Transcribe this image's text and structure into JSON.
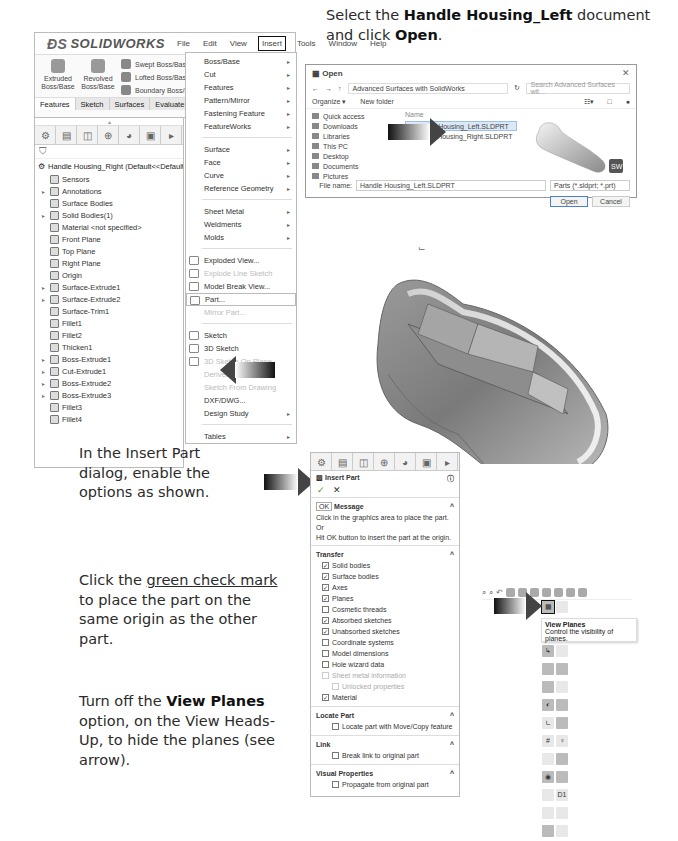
{
  "instructions": {
    "step1": {
      "pre": "Select the ",
      "bold": "Handle Housing_Left",
      "mid": " document and click ",
      "bold2": "Open",
      "post": "."
    },
    "step2": {
      "text": "In the Insert Part dialog, enable the options as shown."
    },
    "step3": {
      "pre": "Click the ",
      "link": "green check mark",
      "post": " to place the part on the same origin as the other part."
    },
    "step4": {
      "pre": "Turn off the ",
      "bold": "View Planes",
      "post": " option, on the View Heads-Up, to hide the planes (see arrow)."
    }
  },
  "solidworks": {
    "logo": "SOLIDWORKS",
    "menu": [
      "File",
      "Edit",
      "View",
      "Insert",
      "Tools",
      "Window",
      "Help"
    ],
    "ribbon": {
      "extruded": "Extruded Boss/Base",
      "revolved": "Revolved Boss/Base",
      "swept": "Swept Boss/Base",
      "lofted": "Lofted Boss/Base",
      "boundary": "Boundary Boss/Base"
    },
    "tabs": [
      "Features",
      "Sketch",
      "Surfaces",
      "Evaluate"
    ],
    "tree_root": "Handle Housing_Right (Default<<Default>_Di",
    "tree": [
      {
        "label": "Sensors",
        "exp": false
      },
      {
        "label": "Annotations",
        "exp": true
      },
      {
        "label": "Surface Bodies",
        "exp": false
      },
      {
        "label": "Solid Bodies(1)",
        "exp": true
      },
      {
        "label": "Material <not specified>",
        "exp": false
      },
      {
        "label": "Front Plane",
        "exp": false
      },
      {
        "label": "Top Plane",
        "exp": false
      },
      {
        "label": "Right Plane",
        "exp": false
      },
      {
        "label": "Origin",
        "exp": false
      },
      {
        "label": "Surface-Extrude1",
        "exp": true
      },
      {
        "label": "Surface-Extrude2",
        "exp": true
      },
      {
        "label": "Surface-Trim1",
        "exp": false
      },
      {
        "label": "Fillet1",
        "exp": false
      },
      {
        "label": "Fillet2",
        "exp": false
      },
      {
        "label": "Thicken1",
        "exp": false
      },
      {
        "label": "Boss-Extrude1",
        "exp": true
      },
      {
        "label": "Cut-Extrude1",
        "exp": true
      },
      {
        "label": "Boss-Extrude2",
        "exp": true
      },
      {
        "label": "Boss-Extrude3",
        "exp": true
      },
      {
        "label": "Fillet3",
        "exp": false
      },
      {
        "label": "Fillet4",
        "exp": false
      }
    ]
  },
  "insert_menu": {
    "group1": [
      "Boss/Base",
      "Cut",
      "Features",
      "Pattern/Mirror",
      "Fastening Feature",
      "FeatureWorks"
    ],
    "group2": [
      "Surface",
      "Face",
      "Curve",
      "Reference Geometry"
    ],
    "group3": [
      "Sheet Metal",
      "Weldments",
      "Molds"
    ],
    "group4": [
      "Exploded View...",
      "Explode Line Sketch",
      "Model Break View...",
      "Part...",
      "Mirror Part..."
    ],
    "group5": [
      "Sketch",
      "3D Sketch",
      "3D Sketch On Plane",
      "Derived Sketch",
      "Sketch From Drawing",
      "DXF/DWG...",
      "Design Study"
    ],
    "group6": [
      "Tables"
    ]
  },
  "open_dialog": {
    "title": "Open",
    "path": "Advanced Surfaces with SolidWorks",
    "search_placeholder": "Search Advanced Surfaces wit...",
    "organize": "Organize ▾",
    "new_folder": "New folder",
    "nav": [
      "Quick access",
      "Downloads",
      "Libraries",
      "This PC",
      "Desktop",
      "Documents",
      "Pictures"
    ],
    "col_name": "Name",
    "files": [
      "Handle Housing_Left.SLDPRT",
      "Handle Housing_Right.SLDPRT"
    ],
    "file_name_label": "File name:",
    "file_name_value": "Handle Housing_Left.SLDPRT",
    "file_type": "Parts (*.sldprt; *.prt)",
    "open_btn": "Open",
    "cancel_btn": "Cancel",
    "sw_badge": "SW"
  },
  "insert_part": {
    "title": "Insert Part",
    "ok_tooltip": "OK",
    "message_header": "Message",
    "message1": "Click in the graphics area to place the part.",
    "or": "Or",
    "message2": "Hit OK button to insert the part at the origin.",
    "transfer_header": "Transfer",
    "options": [
      {
        "label": "Solid bodies",
        "checked": true,
        "disabled": false,
        "indent": false
      },
      {
        "label": "Surface bodies",
        "checked": true,
        "disabled": false,
        "indent": false
      },
      {
        "label": "Axes",
        "checked": true,
        "disabled": false,
        "indent": false
      },
      {
        "label": "Planes",
        "checked": true,
        "disabled": false,
        "indent": false
      },
      {
        "label": "Cosmetic threads",
        "checked": false,
        "disabled": false,
        "indent": false
      },
      {
        "label": "Absorbed sketches",
        "checked": true,
        "disabled": false,
        "indent": false
      },
      {
        "label": "Unabsorbed sketches",
        "checked": true,
        "disabled": false,
        "indent": false
      },
      {
        "label": "Coordinate systems",
        "checked": false,
        "disabled": false,
        "indent": false
      },
      {
        "label": "Model dimensions",
        "checked": false,
        "disabled": false,
        "indent": false
      },
      {
        "label": "Hole wizard data",
        "checked": false,
        "disabled": false,
        "indent": false
      },
      {
        "label": "Sheet metal information",
        "checked": false,
        "disabled": true,
        "indent": false
      },
      {
        "label": "Unlocked properties",
        "checked": false,
        "disabled": true,
        "indent": true
      },
      {
        "label": "Material",
        "checked": true,
        "disabled": false,
        "indent": false
      }
    ],
    "locate_header": "Locate Part",
    "locate_option": "Locate part with Move/Copy feature",
    "link_header": "Link",
    "link_option": "Break link to original part",
    "visual_header": "Visual Properties",
    "visual_option": "Propagate from original part"
  },
  "heads_up": {
    "tooltip_title": "View Planes",
    "tooltip_desc": "Control the visibility of planes.",
    "d1_label": "D1"
  }
}
